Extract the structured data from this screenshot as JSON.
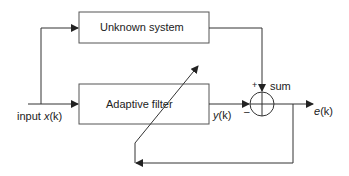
{
  "diagram": {
    "blocks": {
      "unknown_system": "Unknown system",
      "adaptive_filter": "Adaptive filter"
    },
    "signals": {
      "input_prefix": "input ",
      "input_var": "x",
      "input_idx": "(k)",
      "output_var": "y",
      "output_idx": "(k)",
      "error_var": "e",
      "error_idx": "(k)"
    },
    "sum": {
      "label": "sum",
      "plus": "+",
      "minus": "–"
    },
    "colors": {
      "line": "#333333",
      "box_border": "#555555"
    }
  }
}
